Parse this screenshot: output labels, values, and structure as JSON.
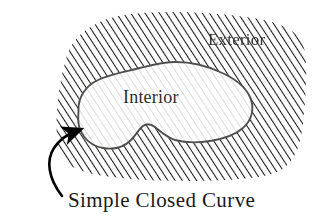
{
  "figure": {
    "background_color": "#ffffff",
    "labels": {
      "exterior": "Exterior",
      "interior": "Interior",
      "caption": "Simple Closed Curve"
    },
    "colors": {
      "exterior_hatch": "#1a1a1a",
      "interior_hatch": "#b9b9b9",
      "curve_stroke": "#4a4a48",
      "arrow": "#000000",
      "text": "#1c1c1a",
      "interior_fill": "#ffffff"
    },
    "hatching": {
      "angle_deg": 33,
      "exterior_spacing_px": 6,
      "exterior_line_width_px": 2,
      "interior_spacing_px": 6,
      "interior_line_width_px": 1
    },
    "regions": [
      {
        "name": "exterior-region",
        "label": "Exterior",
        "hatch": "dark-dense"
      },
      {
        "name": "interior-region",
        "label": "Interior",
        "hatch": "light-sparse"
      }
    ],
    "annotation": {
      "type": "curved-arrow",
      "points_to": "simple-closed-curve-boundary",
      "label": "Simple Closed Curve"
    }
  }
}
